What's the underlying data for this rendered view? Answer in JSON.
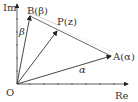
{
  "diagram": {
    "type": "complex-plane-vectors",
    "axes": {
      "x_label": "Re",
      "y_label": "Im",
      "origin_label": "O"
    },
    "points": [
      {
        "name": "B",
        "label": "B(β)"
      },
      {
        "name": "P",
        "label": "P(z)"
      },
      {
        "name": "A",
        "label": "A(α)"
      }
    ],
    "vector_labels": {
      "OB": "β",
      "OA": "α"
    },
    "colors": {
      "line": "#333333",
      "helper": "#bbbbbb"
    }
  }
}
